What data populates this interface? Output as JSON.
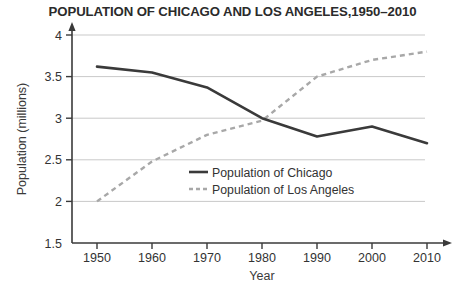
{
  "chart_data": {
    "type": "line",
    "title": "POPULATION OF CHICAGO AND LOS ANGELES,1950–2010",
    "xlabel": "Year",
    "ylabel": "Population (millions)",
    "categories": [
      1950,
      1960,
      1970,
      1980,
      1990,
      2000,
      2010
    ],
    "x_tick_labels": [
      "1950",
      "1960",
      "1970",
      "1980",
      "1990",
      "2000",
      "2010"
    ],
    "y_tick_labels": [
      "1.5",
      "2",
      "2.5",
      "3",
      "3.5",
      "4"
    ],
    "y_ticks": [
      1.5,
      2,
      2.5,
      3,
      3.5,
      4
    ],
    "xlim": [
      1950,
      2010
    ],
    "ylim": [
      1.5,
      4
    ],
    "grid": "horizontal",
    "legend_position": "center-right-inside",
    "series": [
      {
        "name": "Population of Chicago",
        "style": "solid",
        "color": "#3a3a3a",
        "values": [
          3.62,
          3.55,
          3.37,
          3.0,
          2.78,
          2.9,
          2.7
        ]
      },
      {
        "name": "Population of Los Angeles",
        "style": "dashed",
        "color": "#a8a8a8",
        "values": [
          2.0,
          2.48,
          2.8,
          2.97,
          3.5,
          3.7,
          3.8
        ]
      }
    ]
  },
  "legend": {
    "items": [
      {
        "label": "Population of Chicago"
      },
      {
        "label": "Population of Los Angeles"
      }
    ]
  },
  "colors": {
    "chicago_line": "#3a3a3a",
    "losangeles_line": "#a8a8a8",
    "gridline": "#c9c9c9",
    "axis": "#3a3a3a",
    "title_text": "#2b2b2b"
  }
}
